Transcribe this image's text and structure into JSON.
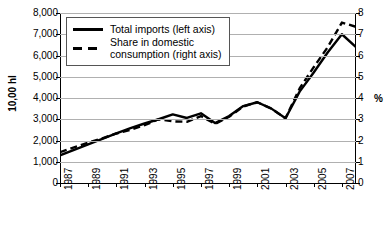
{
  "chart_data": {
    "type": "line",
    "title": "",
    "xlabel": "",
    "ylabel": "10,00 hl",
    "ylabel_right": "%",
    "xlim": [
      1987,
      2008
    ],
    "ylim": [
      0,
      8000
    ],
    "ylim_right": [
      0,
      8
    ],
    "grid": true,
    "legend_position": "top-left",
    "x": [
      1987,
      1988,
      1989,
      1990,
      1991,
      1992,
      1993,
      1994,
      1995,
      1996,
      1997,
      1998,
      1999,
      2000,
      2001,
      2002,
      2003,
      2004,
      2005,
      2006,
      2007,
      2008
    ],
    "xtick_labels": [
      "1987",
      "1989",
      "1991",
      "1993",
      "1995",
      "1997",
      "1999",
      "2001",
      "2003",
      "2005",
      "2007"
    ],
    "ytick_labels_left": [
      "8,000",
      "7,000",
      "6,000",
      "5,000",
      "4,000",
      "3,000",
      "2,000",
      "1,000",
      "0"
    ],
    "ytick_values_left": [
      8000,
      7000,
      6000,
      5000,
      4000,
      3000,
      2000,
      1000,
      0
    ],
    "ytick_labels_right": [
      "8",
      "7",
      "6",
      "5",
      "4",
      "3",
      "2",
      "1",
      "0"
    ],
    "ytick_values_right": [
      8,
      7,
      6,
      5,
      4,
      3,
      2,
      1,
      0
    ],
    "series": [
      {
        "name": "Total imports (left axis)",
        "axis": "left",
        "style": "solid",
        "values": [
          1300,
          1560,
          1820,
          2080,
          2330,
          2580,
          2800,
          3000,
          3230,
          3060,
          3280,
          2820,
          3150,
          3620,
          3800,
          3500,
          3050,
          4300,
          5200,
          6150,
          7000,
          6400
        ]
      },
      {
        "name": "Share in domestic consumption (right axis)",
        "axis": "right",
        "style": "dashed",
        "values": [
          1.45,
          1.68,
          1.9,
          2.1,
          2.33,
          2.5,
          2.72,
          3.0,
          2.9,
          2.88,
          3.15,
          2.78,
          3.12,
          3.6,
          3.8,
          3.5,
          3.05,
          4.45,
          5.45,
          6.4,
          7.55,
          7.35
        ]
      }
    ]
  },
  "legend": {
    "items": [
      {
        "label": "Total imports (left axis)",
        "style": "solid"
      },
      {
        "label": "Share in domestic",
        "label2": "consumption (right axis)",
        "style": "dashed"
      }
    ]
  },
  "colors": {
    "line": "#000000",
    "grid": "#b0b0b0",
    "axis": "#000000",
    "background": "#ffffff"
  }
}
